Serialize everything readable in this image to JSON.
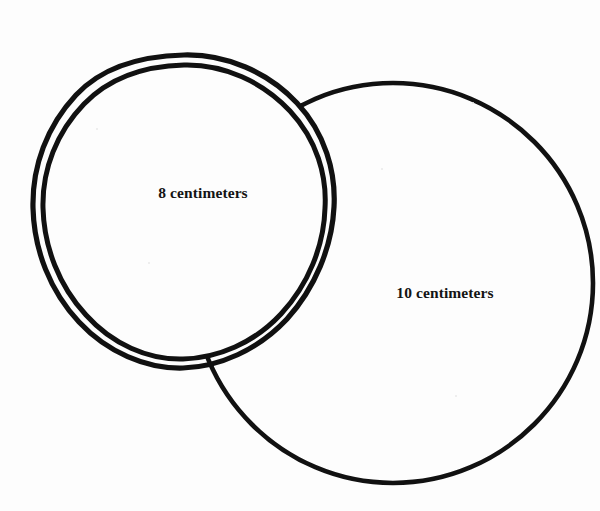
{
  "figure": {
    "type": "geometry-diagram",
    "background_color": "#fdfdfd",
    "ink_color": "#111111",
    "width": 600,
    "height": 511
  },
  "shapes": {
    "small_circle": {
      "name": "small-circle",
      "label": "8 centimeters",
      "diameter_value": 8,
      "unit": "centimeters",
      "center_x": 183,
      "center_y": 205,
      "outer_radius": 150,
      "inner_radius": 141,
      "stroke_width": 5,
      "double_stroke": true
    },
    "large_circle": {
      "name": "large-circle",
      "label": "10 centimeters",
      "diameter_value": 10,
      "unit": "centimeters",
      "center_x": 393,
      "center_y": 283,
      "outer_radius": 200,
      "stroke_width": 4.5,
      "double_stroke": false
    }
  },
  "labels": {
    "small": "8 centimeters",
    "large": "10 centimeters"
  }
}
